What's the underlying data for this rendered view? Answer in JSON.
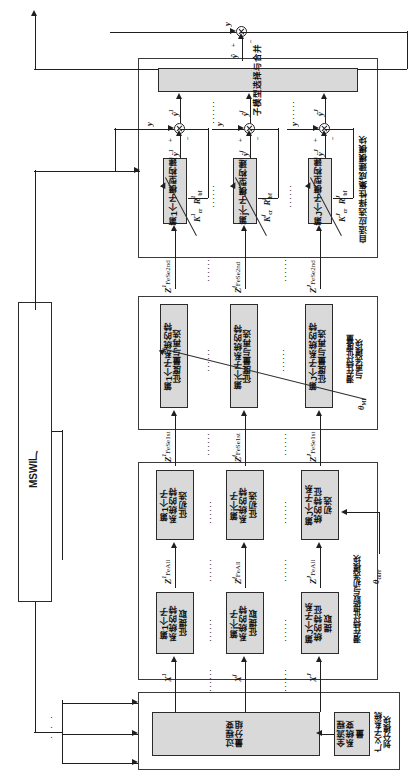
{
  "figure": {
    "orientation": "rotated-90"
  },
  "plant": {
    "label": "MSWI厂"
  },
  "modules": {
    "ensemble": {
      "label": "自适应选择性集成建模模块"
    },
    "latent_remeasure": {
      "label": "潜在特征度量\n与再选模块"
    },
    "latent_extract": {
      "label": "潜在特征提取与初选模块"
    },
    "subsystem_division": {
      "label": "广义子系统\n划分模块"
    }
  },
  "blocks": {
    "merge": {
      "label": "子模型选择与合并"
    },
    "submodel": [
      {
        "label": "第1个子模型构建"
      },
      {
        "label": "第j个子模型构建"
      },
      {
        "label": "第J个子模型构建"
      }
    ],
    "remeasure": [
      {
        "label": "第1个子系统的特\n征度量与再选"
      },
      {
        "label": "第j个子系统的特\n征度量与再选"
      },
      {
        "label": "第J个子系统的特\n征度量与再选"
      }
    ],
    "preselect": [
      {
        "label": "第1个子\n系统的特\n征初选"
      },
      {
        "label": "第j个子\n系统的特\n征初选"
      },
      {
        "label": "第J个子系\n统的特征\n初选"
      }
    ],
    "extract": [
      {
        "label": "第1个子\n系统的特\n征提取"
      },
      {
        "label": "第j个子\n系统的特\n征提取"
      },
      {
        "label": "第J个子系\n统的特征\n提取"
      }
    ],
    "grouping": {
      "label": "过程变\n量分组"
    },
    "all_vars": {
      "label": "全流程\n系统变\n量"
    }
  },
  "signals": {
    "y_true": "y",
    "y_hat_total": "ŷ",
    "y_hat_sub": [
      "ŷ¹",
      "ŷʲ",
      "ŷᴶ"
    ],
    "y_err_sub": [
      "ÿ¹",
      "ÿʲ",
      "ÿᴶ"
    ],
    "z_fese2nd": [
      "Z¹",
      "Zʲ",
      "Zᴶ"
    ],
    "z_fese2nd_sub": "FeSe2nd",
    "z_fese1st_sub": "FeSe1st",
    "z_feall_sub": "FeAll",
    "x_inputs": [
      "X¹",
      "Xʲ",
      "Xᴶ"
    ],
    "plus": "+",
    "minus": "−"
  },
  "params": {
    "submodel": [
      {
        "k": "K",
        "k_sup": "1",
        "k_sub": "cr",
        "r": "R",
        "r_sup": "1",
        "r_sub": "bf"
      },
      {
        "k": "K",
        "k_sup": "j",
        "k_sub": "cr",
        "r": "R",
        "r_sup": "j",
        "r_sub": "bf"
      },
      {
        "k": "K",
        "k_sup": "J",
        "k_sub": "cr",
        "r": "R",
        "r_sup": "J",
        "r_sub": "bf"
      }
    ],
    "theta_mi": {
      "sym": "θ",
      "sub": "MI"
    },
    "theta_corr": {
      "sym": "θ",
      "sub": "corr"
    }
  },
  "ellipsis": "· · · · · ·"
}
